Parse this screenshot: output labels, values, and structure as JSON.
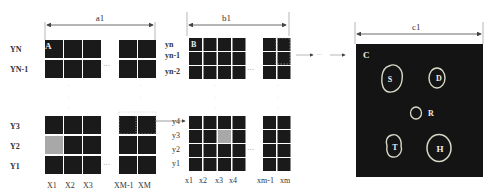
{
  "panel_a": {
    "dimension_label": "a1",
    "corner_label": "A",
    "top_row_labels": [
      "YN",
      "YN-1"
    ],
    "bottom_row_labels": [
      "Y3",
      "Y2",
      "Y1"
    ],
    "column_labels": [
      "X1",
      "X2",
      "X3",
      "XM-1",
      "XM"
    ],
    "ellipsis": "···",
    "highlighted_cell": "X1,Y2"
  },
  "panel_b": {
    "dimension_label": "b1",
    "corner_label": "B",
    "top_row_labels": [
      "yn",
      "yn-1",
      "yn-2"
    ],
    "bottom_row_labels": [
      "y4",
      "y3",
      "y2",
      "y1"
    ],
    "column_labels": [
      "x1",
      "x2",
      "x3",
      "x4",
      "xm-1",
      "xm"
    ],
    "ellipsis": "···",
    "highlighted_cell": "x3,y3"
  },
  "panel_c": {
    "dimension_label": "c1",
    "corner_label": "C",
    "regions": [
      {
        "label": "S"
      },
      {
        "label": "D"
      },
      {
        "label": "R"
      },
      {
        "label": "T"
      },
      {
        "label": "H"
      }
    ]
  },
  "connector": {
    "ellipsis": "···"
  },
  "colors": {
    "cell_dark": "#1a1a1a",
    "cell_highlight": "#a8a8a8",
    "outline": "#d8d8c8"
  }
}
